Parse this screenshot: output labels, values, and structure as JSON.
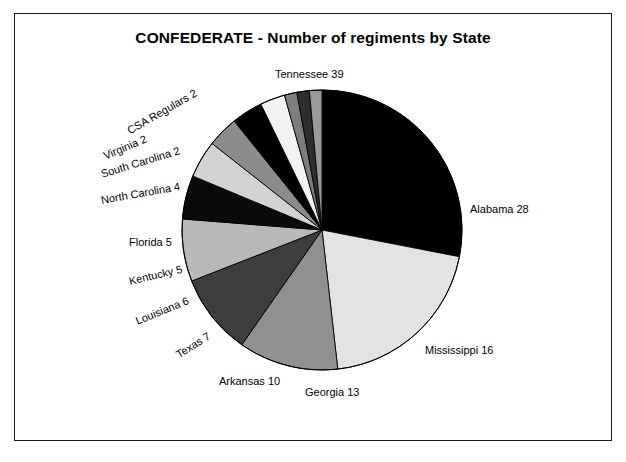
{
  "figure": {
    "title": "CONFEDERATE - Number of regiments by State",
    "frame_color": "#1a1a1a",
    "background": "#ffffff"
  },
  "chart_data": {
    "type": "pie",
    "title": "CONFEDERATE - Number of regiments by State",
    "xlabel": "",
    "ylabel": "",
    "total": 139,
    "units": "regiments",
    "start_angle_deg": 0,
    "direction": "clockwise",
    "legend": "none",
    "labels_position": "outside-radial",
    "categories": [
      "Tennessee",
      "Alabama",
      "Mississippi",
      "Georgia",
      "Arkansas",
      "Texas",
      "Louisiana",
      "Kentucky",
      "Florida",
      "North Carolina",
      "South Carolina",
      "Virginia",
      "CSA Regulars"
    ],
    "values": [
      39,
      28,
      16,
      13,
      10,
      7,
      6,
      5,
      5,
      4,
      2,
      2,
      2
    ],
    "slices": [
      {
        "name": "Tennessee",
        "value": 39,
        "label": "Tennessee 39",
        "color": "#000000",
        "label_x": 275,
        "label_y": 68,
        "rotate": 0
      },
      {
        "name": "Alabama",
        "value": 28,
        "label": "Alabama 28",
        "color": "#e3e3e3",
        "label_x": 470,
        "label_y": 203,
        "rotate": 0
      },
      {
        "name": "Mississippi",
        "value": 16,
        "label": "Mississippi 16",
        "color": "#909090",
        "label_x": 425,
        "label_y": 344,
        "rotate": 0
      },
      {
        "name": "Georgia",
        "value": 13,
        "label": "Georgia 13",
        "color": "#3d3d3d",
        "label_x": 305,
        "label_y": 386,
        "rotate": 0
      },
      {
        "name": "Arkansas",
        "value": 10,
        "label": "Arkansas 10",
        "color": "#b9b9b9",
        "label_x": 219,
        "label_y": 375,
        "rotate": 0
      },
      {
        "name": "Texas",
        "value": 7,
        "label": "Texas 7",
        "color": "#0a0a0a",
        "label_x": 177,
        "label_y": 349,
        "rotate": -32
      },
      {
        "name": "Louisiana",
        "value": 6,
        "label": "Louisiana 6",
        "color": "#d2d2d2",
        "label_x": 136,
        "label_y": 315,
        "rotate": -22
      },
      {
        "name": "Kentucky",
        "value": 5,
        "label": "Kentucky 5",
        "color": "#8c8c8c",
        "label_x": 129,
        "label_y": 275,
        "rotate": -13
      },
      {
        "name": "Florida",
        "value": 5,
        "label": "Florida 5",
        "color": "#000000",
        "label_x": 129,
        "label_y": 236,
        "rotate": 0
      },
      {
        "name": "North Carolina",
        "value": 4,
        "label": "North Carolina 4",
        "color": "#f2f2f2",
        "label_x": 101,
        "label_y": 194,
        "rotate": -10
      },
      {
        "name": "South Carolina",
        "value": 2,
        "label": "South Carolina 2",
        "color": "#7d7d7d",
        "label_x": 101,
        "label_y": 168,
        "rotate": -17
      },
      {
        "name": "Virginia",
        "value": 2,
        "label": "Virginia 2",
        "color": "#2e2e2e",
        "label_x": 104,
        "label_y": 150,
        "rotate": -23
      },
      {
        "name": "CSA Regulars",
        "value": 2,
        "label": "CSA Regulars 2",
        "color": "#9a9a9a",
        "label_x": 128,
        "label_y": 125,
        "rotate": -30
      }
    ],
    "geometry": {
      "center_x": 322,
      "center_y": 230,
      "radius": 140
    }
  }
}
